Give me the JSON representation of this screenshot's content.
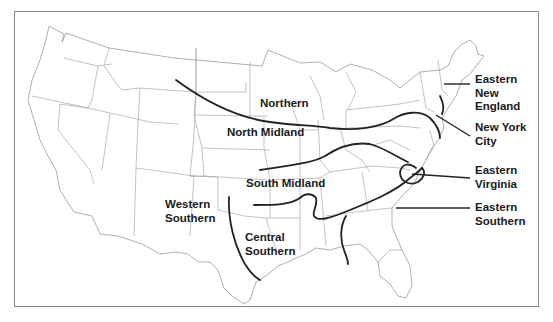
{
  "map": {
    "title": "American English dialect regions",
    "colors": {
      "boundary": "#222222",
      "state_line": "#9a9a9a",
      "frame": "#8a8a8a",
      "text": "#1a1a1a"
    },
    "regions": {
      "northern": {
        "line1": "Northern"
      },
      "north_midland": {
        "line1": "North Midland"
      },
      "south_midland": {
        "line1": "South Midland"
      },
      "western_southern": {
        "line1": "Western",
        "line2": "Southern"
      },
      "central_southern": {
        "line1": "Central",
        "line2": "Southern"
      },
      "eastern_new_england": {
        "line1": "Eastern",
        "line2": "New",
        "line3": "England"
      },
      "new_york_city": {
        "line1": "New York",
        "line2": "City"
      },
      "eastern_virginia": {
        "line1": "Eastern",
        "line2": "Virginia"
      },
      "eastern_southern": {
        "line1": "Eastern",
        "line2": "Southern"
      }
    }
  }
}
